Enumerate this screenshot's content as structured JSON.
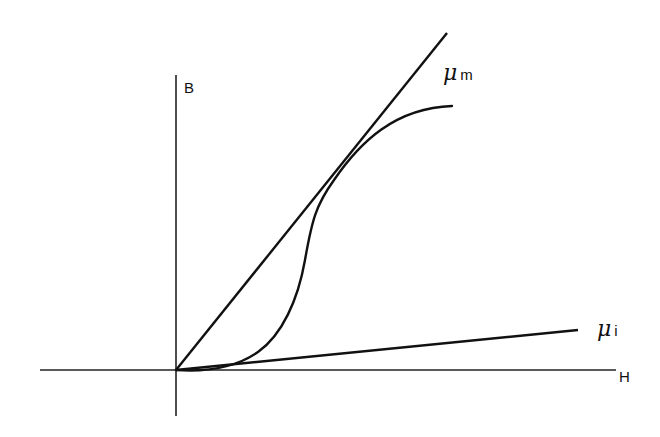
{
  "diagram": {
    "type": "B-H magnetization curve",
    "axes": {
      "vertical_label": "B",
      "horizontal_label": "H"
    },
    "lines": [
      {
        "symbol": "μ",
        "subscript": "m",
        "description": "maximum permeability line, tangent to curve"
      },
      {
        "symbol": "μ",
        "subscript": "i",
        "description": "initial permeability line"
      }
    ],
    "curve": {
      "description": "S-shaped magnetization curve from origin, saturating at top right"
    },
    "colors": {
      "ink": "#111111",
      "background": "#ffffff"
    }
  }
}
